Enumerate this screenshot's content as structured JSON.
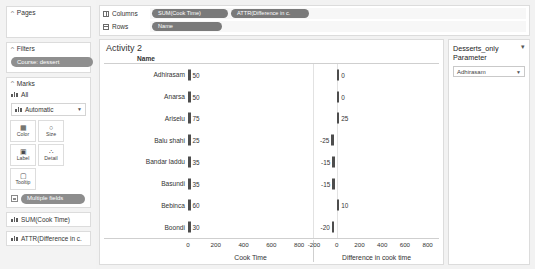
{
  "sidebar": {
    "pages": {
      "label": "Pages"
    },
    "filters": {
      "label": "Filters",
      "pill": "Course: dessert"
    },
    "marks": {
      "label": "Marks",
      "all_label": "All",
      "type_label": "Automatic",
      "buttons": [
        {
          "name": "color",
          "label": "Color",
          "glyph": "▦"
        },
        {
          "name": "size",
          "label": "Size",
          "glyph": "○"
        },
        {
          "name": "label",
          "label": "Label",
          "glyph": "▣"
        },
        {
          "name": "detail",
          "label": "Detail",
          "glyph": "∴"
        },
        {
          "name": "tooltip",
          "label": "Tooltip",
          "glyph": "▢"
        }
      ],
      "multiple_fields_pill": "Multiple fields",
      "field_pills": [
        "SUM(Cook Time)",
        "ATTR(Difference in c."
      ]
    }
  },
  "shelves": {
    "columns_label": "Columns",
    "rows_label": "Rows",
    "columns_pills": [
      "SUM(Cook Time)",
      "ATTR(Difference in c."
    ],
    "rows_pills": [
      "Name"
    ]
  },
  "viz": {
    "title": "Activity 2",
    "row_header": "Name"
  },
  "parameter": {
    "title": "Desserts_only Parameter",
    "menu_glyph": "▾",
    "selected": "Adhirasam",
    "arrow_glyph": "▼"
  },
  "chart_data": {
    "type": "bar",
    "title": "Activity 2",
    "orientation": "horizontal",
    "categories": [
      "Adhirasam",
      "Anarsa",
      "Ariselu",
      "Balu shahi",
      "Bandar laddu",
      "Basundi",
      "Bebinca",
      "Boondi"
    ],
    "panes": [
      {
        "name": "Cook Time",
        "xlabel": "Cook Time",
        "values": [
          50,
          50,
          75,
          25,
          35,
          35,
          60,
          30
        ],
        "labels": [
          "50",
          "50",
          "75",
          "25",
          "35",
          "35",
          "60",
          "30"
        ],
        "xlim": [
          0,
          900
        ],
        "ticks": [
          0,
          200,
          400,
          600,
          800
        ],
        "tick_labels": [
          "0",
          "200",
          "400",
          "600",
          "800"
        ]
      },
      {
        "name": "Difference in cook time",
        "xlabel": "Difference in cook time",
        "values": [
          0,
          0,
          25,
          -25,
          -15,
          -15,
          10,
          -20
        ],
        "labels": [
          "0",
          "0",
          "25",
          "-25",
          "-15",
          "-15",
          "10",
          "-20"
        ],
        "xlim": [
          -200,
          900
        ],
        "ticks": [
          -200,
          0,
          200,
          400,
          600,
          800
        ],
        "tick_labels": [
          "-200",
          "0",
          "200",
          "400",
          "600",
          "800"
        ]
      }
    ],
    "grid": true,
    "legend": "none",
    "bar_color": "#4d4d4d"
  }
}
